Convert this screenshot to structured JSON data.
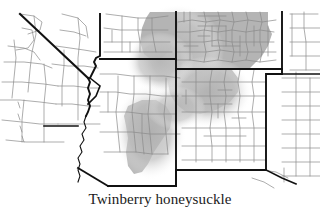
{
  "figure": {
    "caption": "Twinberry honeysuckle",
    "map_title": "Twinberry honeysuckle",
    "map_type": "species-distribution-range-map",
    "region_label": "Southwestern United States",
    "background_color": "#ffffff",
    "county_line_color": "#8a8a8a",
    "state_line_color": "#1a1a1a",
    "range_fill_color": "#b4b4b4",
    "range_fill_light_color": "#d2d2d2",
    "legend_note": "Shaded areas indicate species distribution"
  },
  "states": [
    {
      "code": "CA",
      "name": "California"
    },
    {
      "code": "NV",
      "name": "Nevada"
    },
    {
      "code": "UT",
      "name": "Utah"
    },
    {
      "code": "AZ",
      "name": "Arizona"
    },
    {
      "code": "CO",
      "name": "Colorado"
    },
    {
      "code": "NM",
      "name": "New Mexico"
    },
    {
      "code": "TX",
      "name": "Texas"
    },
    {
      "code": "KS",
      "name": "Kansas"
    },
    {
      "code": "OK",
      "name": "Oklahoma"
    }
  ],
  "range_areas": [
    {
      "id": "colorado-core",
      "state": "CO",
      "density": "high"
    },
    {
      "id": "utah-east",
      "state": "UT",
      "density": "high"
    },
    {
      "id": "new-mexico-north",
      "state": "NM",
      "density": "high"
    },
    {
      "id": "arizona-central",
      "state": "AZ",
      "density": "high"
    },
    {
      "id": "colorado-plateau-halo",
      "state": "UT",
      "density": "low"
    }
  ]
}
